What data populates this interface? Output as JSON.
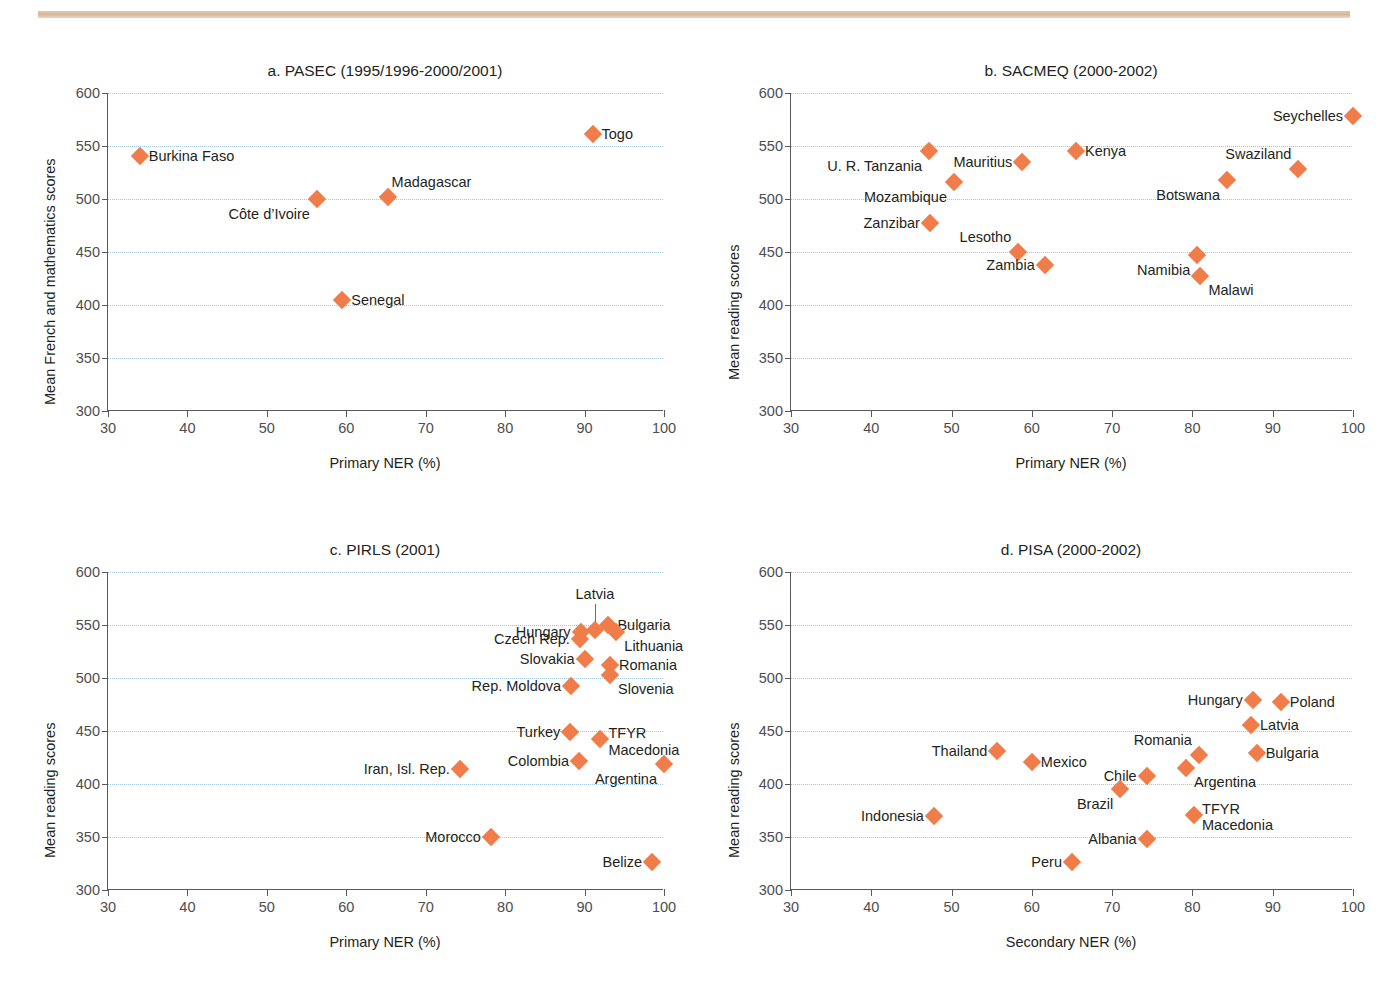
{
  "header": {
    "cut_text": ""
  },
  "axis": {
    "y_ticks": [
      600,
      550,
      500,
      450,
      400,
      350,
      300
    ],
    "x_ticks": [
      30,
      40,
      50,
      60,
      70,
      80,
      90,
      100
    ],
    "ylim": [
      300,
      600
    ],
    "xlim": [
      30,
      100
    ]
  },
  "colors": {
    "marker": "#f07c4a",
    "grid": "#9ec6e0",
    "axis": "#58595b",
    "rule": "#d8b698"
  },
  "chart_data": [
    {
      "id": "a",
      "type": "scatter",
      "title": "a. PASEC (1995/1996-2000/2001)",
      "xlabel": "Primary NER (%)",
      "ylabel": "Mean French and mathematics scores",
      "xlim": [
        30,
        100
      ],
      "ylim": [
        300,
        600
      ],
      "grid": true,
      "legend": "none",
      "points": [
        {
          "label": "Burkina Faso",
          "x": 34.0,
          "y": 541,
          "side": "right"
        },
        {
          "label": "Togo",
          "x": 91.0,
          "y": 561,
          "side": "right"
        },
        {
          "label": "Côte d’Ivoire",
          "x": 56.3,
          "y": 500,
          "side": "below-left"
        },
        {
          "label": "Madagascar",
          "x": 65.2,
          "y": 502,
          "side": "above-right"
        },
        {
          "label": "Senegal",
          "x": 59.5,
          "y": 405,
          "side": "right"
        }
      ]
    },
    {
      "id": "b",
      "type": "scatter",
      "title": "b. SACMEQ (2000-2002)",
      "xlabel": "Primary NER (%)",
      "ylabel": "Mean reading scores",
      "xlim": [
        30,
        100
      ],
      "ylim": [
        300,
        600
      ],
      "grid": true,
      "legend": "none",
      "points": [
        {
          "label": "Seychelles",
          "x": 100.0,
          "y": 578,
          "side": "left"
        },
        {
          "label": "U. R. Tanzania",
          "x": 47.2,
          "y": 545,
          "side": "below-left"
        },
        {
          "label": "Mauritius",
          "x": 58.8,
          "y": 535,
          "side": "left"
        },
        {
          "label": "Kenya",
          "x": 65.5,
          "y": 545,
          "side": "right"
        },
        {
          "label": "Swaziland",
          "x": 93.2,
          "y": 528,
          "side": "above-left"
        },
        {
          "label": "Botswana",
          "x": 84.3,
          "y": 518,
          "side": "below-left"
        },
        {
          "label": "Mozambique",
          "x": 50.3,
          "y": 516,
          "side": "below-left"
        },
        {
          "label": "Zanzibar",
          "x": 47.3,
          "y": 477,
          "side": "left"
        },
        {
          "label": "Lesotho",
          "x": 58.3,
          "y": 450,
          "side": "above-left"
        },
        {
          "label": "Zambia",
          "x": 61.6,
          "y": 438,
          "side": "left"
        },
        {
          "label": "Namibia",
          "x": 80.6,
          "y": 447,
          "side": "below-left"
        },
        {
          "label": "Malawi",
          "x": 81.0,
          "y": 427,
          "side": "below-right"
        }
      ]
    },
    {
      "id": "c",
      "type": "scatter",
      "title": "c. PIRLS (2001)",
      "xlabel": "Primary NER (%)",
      "ylabel": "Mean reading scores",
      "xlim": [
        30,
        100
      ],
      "ylim": [
        300,
        600
      ],
      "grid": true,
      "legend": "none",
      "points": [
        {
          "label": "Latvia",
          "x": 91.3,
          "y": 545,
          "side": "leader-up"
        },
        {
          "label": "Hungary",
          "x": 89.5,
          "y": 543,
          "side": "left"
        },
        {
          "label": "Bulgaria",
          "x": 93.0,
          "y": 550,
          "side": "right"
        },
        {
          "label": "Czech Rep.",
          "x": 89.4,
          "y": 537,
          "side": "left"
        },
        {
          "label": "Lithuania",
          "x": 94.0,
          "y": 543,
          "side": "below-right"
        },
        {
          "label": "Slovakia",
          "x": 90.0,
          "y": 518,
          "side": "left"
        },
        {
          "label": "Romania",
          "x": 93.2,
          "y": 512,
          "side": "right"
        },
        {
          "label": "Slovenia",
          "x": 93.2,
          "y": 503,
          "side": "below-right"
        },
        {
          "label": "Rep. Moldova",
          "x": 88.3,
          "y": 492,
          "side": "left"
        },
        {
          "label": "Turkey",
          "x": 88.2,
          "y": 449,
          "side": "left"
        },
        {
          "label": "TFYR Macedonia",
          "x": 92.0,
          "y": 442,
          "side": "tfyr-right"
        },
        {
          "label": "Colombia",
          "x": 89.3,
          "y": 422,
          "side": "left"
        },
        {
          "label": "Argentina",
          "x": 100.0,
          "y": 419,
          "side": "below-left"
        },
        {
          "label": "Iran, Isl. Rep.",
          "x": 74.3,
          "y": 414,
          "side": "left"
        },
        {
          "label": "Morocco",
          "x": 78.2,
          "y": 350,
          "side": "left"
        },
        {
          "label": "Belize",
          "x": 98.5,
          "y": 326,
          "side": "left"
        }
      ]
    },
    {
      "id": "d",
      "type": "scatter",
      "title": "d. PISA (2000-2002)",
      "xlabel": "Secondary NER (%)",
      "ylabel": "Mean reading scores",
      "xlim": [
        30,
        100
      ],
      "ylim": [
        300,
        600
      ],
      "grid": true,
      "legend": "none",
      "points": [
        {
          "label": "Hungary",
          "x": 87.5,
          "y": 479,
          "side": "left"
        },
        {
          "label": "Poland",
          "x": 91.0,
          "y": 477,
          "side": "right"
        },
        {
          "label": "Latvia",
          "x": 87.3,
          "y": 456,
          "side": "right"
        },
        {
          "label": "Thailand",
          "x": 55.7,
          "y": 431,
          "side": "left"
        },
        {
          "label": "Romania",
          "x": 80.8,
          "y": 427,
          "side": "above-left"
        },
        {
          "label": "Bulgaria",
          "x": 88.0,
          "y": 429,
          "side": "right"
        },
        {
          "label": "Mexico",
          "x": 60.0,
          "y": 421,
          "side": "right"
        },
        {
          "label": "Argentina",
          "x": 79.2,
          "y": 415,
          "side": "below-right"
        },
        {
          "label": "Chile",
          "x": 74.3,
          "y": 408,
          "side": "left"
        },
        {
          "label": "Brazil",
          "x": 71.0,
          "y": 395,
          "side": "below-left"
        },
        {
          "label": "TFYR Macedonia",
          "x": 80.2,
          "y": 371,
          "side": "tfyr-right"
        },
        {
          "label": "Indonesia",
          "x": 47.8,
          "y": 370,
          "side": "left"
        },
        {
          "label": "Albania",
          "x": 74.3,
          "y": 348,
          "side": "left"
        },
        {
          "label": "Peru",
          "x": 65.0,
          "y": 326,
          "side": "left"
        }
      ]
    }
  ]
}
